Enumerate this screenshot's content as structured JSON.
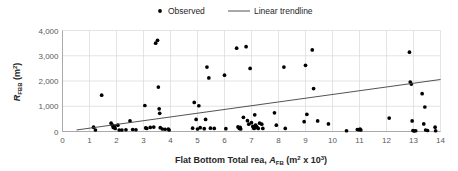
{
  "chart_data": {
    "type": "scatter",
    "title": "",
    "xlabel": "Flat Bottom Total rea, A_FB  (m² x 10³)",
    "xlabel_parts": {
      "lead": "Flat Bottom Total rea, ",
      "symbol": "A",
      "symbol_sub": "FB",
      "units_pre": "  (m",
      "units_sup1": "2",
      "units_mid": " x 10",
      "units_sup2": "3",
      "units_post": ")"
    },
    "ylabel": "R_FBB (m²)",
    "ylabel_parts": {
      "symbol": "R",
      "symbol_sub": "FBB",
      "units_pre": " (m",
      "units_sup": "2",
      "units_post": ")"
    },
    "xlim": [
      0,
      14
    ],
    "ylim": [
      0,
      4000
    ],
    "xticks": [
      0,
      1,
      2,
      3,
      4,
      5,
      6,
      7,
      8,
      9,
      10,
      11,
      12,
      13,
      14
    ],
    "xtick_labels": [
      "0",
      "1",
      "2",
      "3",
      "4",
      "5",
      "6",
      "7",
      "8",
      "9",
      "10",
      "11",
      "12",
      "13",
      "14"
    ],
    "yticks": [
      0,
      1000,
      2000,
      3000,
      4000
    ],
    "ytick_labels": [
      "0",
      "1,000",
      "2,000",
      "3,000",
      "4,000"
    ],
    "grid": true,
    "grid_color": "#d9d9d9",
    "legend_position": "top-center",
    "legend": [
      {
        "name": "Observed",
        "marker": "dot",
        "color": "#000000"
      },
      {
        "name": "Linear trendline",
        "marker": "line",
        "color": "#404040"
      }
    ],
    "series": [
      {
        "name": "Observed",
        "marker_color": "#000000",
        "points": [
          [
            1.15,
            170
          ],
          [
            1.22,
            60
          ],
          [
            1.45,
            1440
          ],
          [
            1.8,
            330
          ],
          [
            1.85,
            250
          ],
          [
            1.88,
            160
          ],
          [
            1.92,
            200
          ],
          [
            1.95,
            120
          ],
          [
            2.05,
            250
          ],
          [
            2.1,
            60
          ],
          [
            2.2,
            60
          ],
          [
            2.35,
            70
          ],
          [
            2.5,
            420
          ],
          [
            2.6,
            80
          ],
          [
            2.72,
            70
          ],
          [
            3.05,
            1030
          ],
          [
            3.08,
            140
          ],
          [
            3.12,
            120
          ],
          [
            3.25,
            160
          ],
          [
            3.38,
            175
          ],
          [
            3.45,
            3500
          ],
          [
            3.52,
            3610
          ],
          [
            3.55,
            1760
          ],
          [
            3.58,
            900
          ],
          [
            3.6,
            720
          ],
          [
            3.62,
            150
          ],
          [
            3.7,
            100
          ],
          [
            3.8,
            90
          ],
          [
            3.92,
            100
          ],
          [
            3.95,
            60
          ],
          [
            4.82,
            130
          ],
          [
            4.88,
            1150
          ],
          [
            4.95,
            480
          ],
          [
            5.0,
            100
          ],
          [
            5.05,
            1020
          ],
          [
            5.1,
            150
          ],
          [
            5.25,
            110
          ],
          [
            5.3,
            480
          ],
          [
            5.35,
            2550
          ],
          [
            5.42,
            2120
          ],
          [
            5.48,
            130
          ],
          [
            5.62,
            120
          ],
          [
            6.0,
            2230
          ],
          [
            6.05,
            110
          ],
          [
            6.45,
            3300
          ],
          [
            6.5,
            180
          ],
          [
            6.55,
            120
          ],
          [
            6.58,
            160
          ],
          [
            6.6,
            100
          ],
          [
            6.7,
            560
          ],
          [
            6.8,
            3360
          ],
          [
            6.85,
            430
          ],
          [
            6.9,
            290
          ],
          [
            6.95,
            2500
          ],
          [
            7.0,
            350
          ],
          [
            7.05,
            200
          ],
          [
            7.08,
            140
          ],
          [
            7.1,
            120
          ],
          [
            7.12,
            660
          ],
          [
            7.15,
            250
          ],
          [
            7.18,
            200
          ],
          [
            7.2,
            160
          ],
          [
            7.25,
            120
          ],
          [
            7.3,
            330
          ],
          [
            7.38,
            290
          ],
          [
            7.42,
            120
          ],
          [
            7.85,
            740
          ],
          [
            7.92,
            250
          ],
          [
            8.2,
            2550
          ],
          [
            8.25,
            120
          ],
          [
            8.95,
            390
          ],
          [
            9.0,
            2620
          ],
          [
            9.05,
            680
          ],
          [
            9.25,
            3230
          ],
          [
            9.3,
            1700
          ],
          [
            9.45,
            420
          ],
          [
            9.85,
            300
          ],
          [
            10.52,
            30
          ],
          [
            10.92,
            80
          ],
          [
            10.98,
            70
          ],
          [
            11.02,
            100
          ],
          [
            11.05,
            60
          ],
          [
            12.1,
            530
          ],
          [
            12.85,
            3140
          ],
          [
            12.88,
            1960
          ],
          [
            12.92,
            1880
          ],
          [
            12.95,
            420
          ],
          [
            12.98,
            40
          ],
          [
            13.02,
            20
          ],
          [
            13.08,
            30
          ],
          [
            13.32,
            1500
          ],
          [
            13.38,
            300
          ],
          [
            13.42,
            970
          ],
          [
            13.45,
            60
          ],
          [
            13.52,
            40
          ],
          [
            13.8,
            170
          ],
          [
            13.82,
            30
          ]
        ]
      }
    ],
    "trendline": {
      "name": "Linear trendline",
      "color": "#404040",
      "x_start": 0.52,
      "y_start": 60,
      "x_end": 14.0,
      "y_end": 2060
    }
  }
}
